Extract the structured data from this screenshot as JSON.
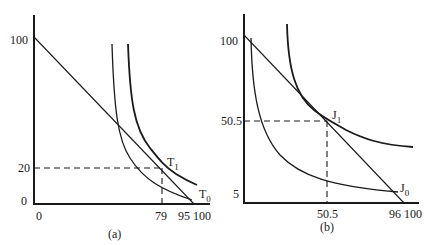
{
  "figure": {
    "panels": [
      {
        "id": "a",
        "caption": "(a)",
        "y_ticks": [
          "100",
          "20",
          "0"
        ],
        "x_ticks": [
          "0",
          "79",
          "95",
          "100"
        ],
        "points": [
          {
            "label": "T",
            "subscript": "1",
            "x": 79,
            "y": 20
          },
          {
            "label": "T",
            "subscript": "0",
            "x": 95,
            "y": 0
          }
        ]
      },
      {
        "id": "b",
        "caption": "(b)",
        "y_ticks": [
          "100",
          "50.5",
          "5"
        ],
        "x_ticks": [
          "50.5",
          "96",
          "100"
        ],
        "points": [
          {
            "label": "J",
            "subscript": "1",
            "x": 50.5,
            "y": 50.5
          },
          {
            "label": "J",
            "subscript": "0",
            "x": 96,
            "y": 5
          }
        ]
      }
    ]
  }
}
